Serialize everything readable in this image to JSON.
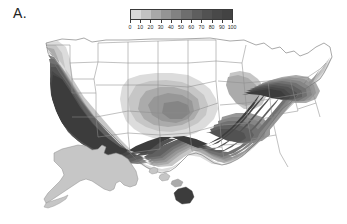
{
  "figure": {
    "panel_label": "A.",
    "background_color": "#ffffff"
  },
  "colorbar": {
    "name": "percent-scale-colorbar",
    "orientation": "horizontal",
    "min": 0,
    "max": 100,
    "step": 10,
    "tick_labels": [
      "0",
      "10",
      "20",
      "30",
      "40",
      "50",
      "60",
      "70",
      "80",
      "90",
      "100"
    ],
    "tick_values": [
      0,
      10,
      20,
      30,
      40,
      50,
      60,
      70,
      80,
      90,
      100
    ],
    "swatch_colors": [
      "#d9d9d9",
      "#c2c2c2",
      "#a8a8a8",
      "#949494",
      "#828282",
      "#6e6e6e",
      "#5e5e5e",
      "#525252",
      "#494949",
      "#434343"
    ],
    "border_color": "#3a3a3a"
  },
  "chart_data": {
    "type": "heatmap",
    "title": "A.",
    "xlabel": "",
    "ylabel": "",
    "subtitle": "",
    "map_region": "United States (contiguous, with Alaska and Hawaii insets)",
    "value_unit": "percent",
    "legend_position": "top-center",
    "grid": false,
    "colormap": "grayscale-discrete-10-steps",
    "colorbar_range": [
      0,
      100
    ],
    "colorbar_ticks": [
      0,
      10,
      20,
      30,
      40,
      50,
      60,
      70,
      80,
      90,
      100
    ],
    "contour_levels": [
      0,
      10,
      20,
      30,
      40,
      50,
      60,
      70,
      80,
      90,
      100
    ],
    "categories": [
      "Pacific Northwest coast",
      "California coast",
      "Inland Pacific / Great Basin",
      "Northern Rockies",
      "Northern Plains",
      "Upper Midwest / Great Lakes",
      "Central Plains",
      "Southern Plains / Texas",
      "Gulf Coast",
      "Lower Mississippi Valley",
      "Southeast / Carolinas",
      "Florida",
      "Mid-Atlantic",
      "Northeast / New England",
      "Ohio Valley",
      "Alaska",
      "Hawaii main islands",
      "Hawaii Big Island"
    ],
    "values": [
      90,
      95,
      55,
      15,
      5,
      5,
      35,
      65,
      75,
      85,
      90,
      80,
      75,
      85,
      55,
      25,
      25,
      85
    ]
  },
  "map": {
    "name": "us-choropleth-map",
    "insets": [
      "alaska",
      "hawaii"
    ],
    "fill_levels": {
      "level_0": "#ffffff",
      "level_1": "#dcdcdc",
      "level_2": "#c6c6c6",
      "level_3": "#ababab",
      "level_4": "#979797",
      "level_5": "#858585",
      "level_6": "#717171",
      "level_7": "#606060",
      "level_8": "#525252",
      "level_9": "#474747",
      "level_10": "#3c3c3c"
    },
    "boundary_color": "#8d8d8d",
    "coastline_color": "#6f6f6f"
  }
}
